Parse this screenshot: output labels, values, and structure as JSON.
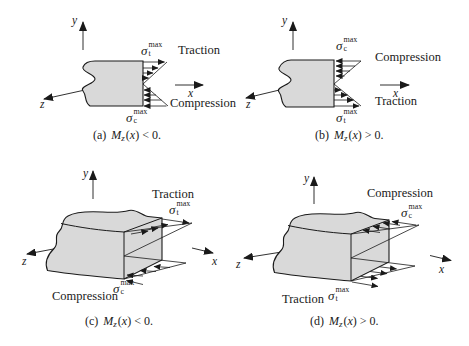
{
  "colors": {
    "ink": "#1a1a1a",
    "beam_fill": "#d9d9d9",
    "background": "#ffffff"
  },
  "panels": {
    "a": {
      "axes": {
        "x": "x",
        "y": "y",
        "z": "z"
      },
      "upper_label": "Traction",
      "lower_label": "Compression",
      "sigma_upper": {
        "sym": "σ",
        "sup": "max",
        "sub": "t"
      },
      "sigma_lower": {
        "sym": "σ",
        "sup": "max",
        "sub": "c"
      },
      "caption": {
        "idx": "(a)",
        "M": "M",
        "msub": "z",
        "open": "(",
        "var": "x",
        "close": ") < 0."
      }
    },
    "b": {
      "axes": {
        "x": "x",
        "y": "y",
        "z": "z"
      },
      "upper_label": "Compression",
      "lower_label": "Traction",
      "sigma_upper": {
        "sym": "σ",
        "sup": "max",
        "sub": "c"
      },
      "sigma_lower": {
        "sym": "σ",
        "sup": "max",
        "sub": "t"
      },
      "caption": {
        "idx": "(b)",
        "M": "M",
        "msub": "z",
        "open": "(",
        "var": "x",
        "close": ") > 0."
      }
    },
    "c": {
      "axes": {
        "x": "x",
        "y": "y",
        "z": "z"
      },
      "upper_label": "Traction",
      "lower_label": "Compression",
      "sigma_upper": {
        "sym": "σ",
        "sup": "max",
        "sub": "t"
      },
      "sigma_lower": {
        "sym": "σ",
        "sup": "max",
        "sub": "c"
      },
      "caption": {
        "idx": "(c)",
        "M": "M",
        "msub": "z",
        "open": "(",
        "var": "x",
        "close": ") < 0."
      }
    },
    "d": {
      "axes": {
        "x": "x",
        "y": "y",
        "z": "z"
      },
      "upper_label": "Compression",
      "lower_label": "Traction",
      "sigma_upper": {
        "sym": "σ",
        "sup": "max",
        "sub": "c"
      },
      "sigma_lower": {
        "sym": "σ",
        "sup": "max",
        "sub": "t"
      },
      "caption": {
        "idx": "(d)",
        "M": "M",
        "msub": "z",
        "open": "(",
        "var": "x",
        "close": ") > 0."
      }
    }
  }
}
